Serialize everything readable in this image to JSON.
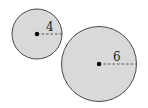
{
  "diagram": {
    "circles": [
      {
        "name": "small-circle",
        "cx": 37,
        "cy": 34,
        "r": 25,
        "radius_label": "4"
      },
      {
        "name": "large-circle",
        "cx": 99,
        "cy": 64,
        "r": 37.5,
        "radius_label": "6"
      }
    ],
    "colors": {
      "fill": "#d9d9d9",
      "stroke": "#4a4a4a",
      "dot": "#000000",
      "dash": "#555555"
    }
  }
}
